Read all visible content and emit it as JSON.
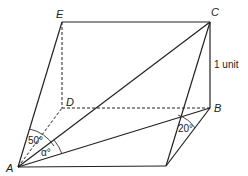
{
  "diagram": {
    "type": "3d-geometry-figure",
    "vertices": {
      "A": "A",
      "B": "B",
      "C": "C",
      "D": "D",
      "E": "E"
    },
    "angles": {
      "angle_50": "50°",
      "angle_alpha": "α°",
      "angle_20": "20°"
    },
    "measurements": {
      "cb_length": "1 unit"
    },
    "edges": {
      "solid": [
        "A-E",
        "E-C",
        "C-B",
        "A-C",
        "A-B",
        "A-F",
        "F-C",
        "F-B"
      ],
      "dashed": [
        "E-D",
        "D-B",
        "A-D"
      ]
    }
  }
}
